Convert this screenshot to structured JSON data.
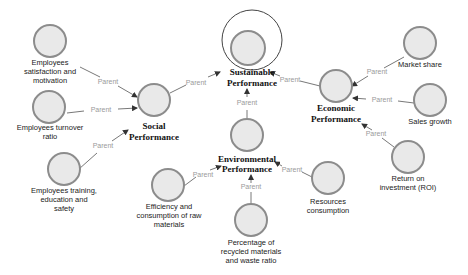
{
  "diagram": {
    "root": {
      "label_line1": "Sustainable",
      "label_line2": "Performance"
    },
    "hubs": {
      "social": {
        "label_line1": "Social",
        "label_line2": "Performance"
      },
      "environmental": {
        "label_line1": "Environmental",
        "label_line2": "Performance"
      },
      "economic": {
        "label_line1": "Economic",
        "label_line2": "Performance"
      }
    },
    "leaves": {
      "employees_satisfaction": {
        "lines": [
          "Employees",
          "satisfaction and",
          "motivation"
        ]
      },
      "employees_turnover": {
        "lines": [
          "Employees turnover",
          "ratio"
        ]
      },
      "employees_training": {
        "lines": [
          "Employees training,",
          "education and",
          "safety"
        ]
      },
      "efficiency": {
        "lines": [
          "Efficiency and",
          "consumption of raw",
          "materials"
        ]
      },
      "percentage_recycled": {
        "lines": [
          "Percentage of",
          "recycled materials",
          "and waste ratio"
        ]
      },
      "resources": {
        "lines": [
          "Resources",
          "consumption"
        ]
      },
      "market_share": {
        "lines": [
          "Market share"
        ]
      },
      "sales_growth": {
        "lines": [
          "Sales growth"
        ]
      },
      "roi": {
        "lines": [
          "Return on",
          "investment (ROI)"
        ]
      }
    },
    "edge_label": "Parent",
    "edges": [
      {
        "from": "Employees satisfaction and motivation",
        "to": "Social Performance",
        "label": "Parent"
      },
      {
        "from": "Employees turnover ratio",
        "to": "Social Performance",
        "label": "Parent"
      },
      {
        "from": "Employees training, education and safety",
        "to": "Social Performance",
        "label": "Parent"
      },
      {
        "from": "Social Performance",
        "to": "Sustainable Performance",
        "label": "Parent"
      },
      {
        "from": "Environmental Performance",
        "to": "Sustainable Performance",
        "label": "Parent"
      },
      {
        "from": "Economic Performance",
        "to": "Sustainable Performance",
        "label": "Parent"
      },
      {
        "from": "Efficiency and consumption of raw materials",
        "to": "Environmental Performance",
        "label": "Parent"
      },
      {
        "from": "Percentage of recycled materials and waste ratio",
        "to": "Environmental Performance",
        "label": "Parent"
      },
      {
        "from": "Resources consumption",
        "to": "Environmental Performance",
        "label": "Parent"
      },
      {
        "from": "Market share",
        "to": "Economic Performance",
        "label": "Parent"
      },
      {
        "from": "Sales growth",
        "to": "Economic Performance",
        "label": "Parent"
      },
      {
        "from": "Return on investment (ROI)",
        "to": "Economic Performance",
        "label": "Parent"
      }
    ],
    "colors": {
      "node_fill": "#e9e9e9",
      "node_stroke": "#8c8c8c",
      "edge": "#555555",
      "edge_label": "#9a9a9a"
    }
  }
}
